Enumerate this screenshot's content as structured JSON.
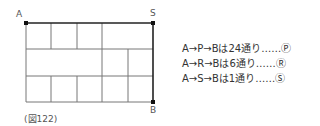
{
  "figure": {
    "caption": "(図122)",
    "points": {
      "A": "A",
      "S": "S",
      "B": "B"
    },
    "grid": {
      "cols": 5,
      "rows": 3,
      "row_segments": [
        {
          "row": 0,
          "vertical_lines_at_cols": [
            1,
            2,
            3
          ]
        },
        {
          "row": 1,
          "vertical_lines_at_cols": [
            3,
            4
          ]
        },
        {
          "row": 2,
          "vertical_lines_at_cols": [
            1,
            2,
            3,
            4
          ]
        }
      ]
    }
  },
  "notes": [
    "A→P→Bは24通り……Ⓟ",
    "A→R→Bは6通り……Ⓡ",
    "A→S→Bは1通り……Ⓢ"
  ]
}
